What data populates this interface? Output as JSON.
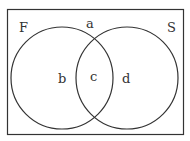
{
  "diagram": {
    "type": "venn",
    "sets": [
      {
        "name": "F",
        "label": "F"
      },
      {
        "name": "S",
        "label": "S"
      }
    ],
    "regions": {
      "outside": "a",
      "F_only": "b",
      "F_and_S": "c",
      "S_only": "d"
    },
    "colors": {
      "stroke": "#333333",
      "background": "#ffffff"
    }
  }
}
